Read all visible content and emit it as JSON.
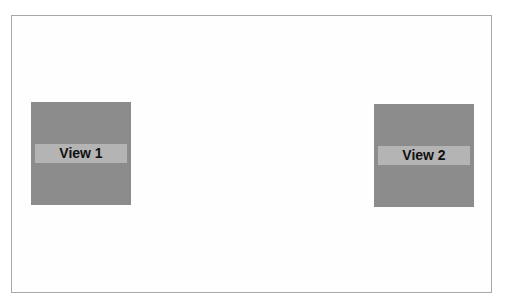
{
  "views": [
    {
      "label": "View 1"
    },
    {
      "label": "View 2"
    }
  ],
  "colors": {
    "frame_border": "#a8a8a8",
    "view_bg": "#8c8c8c",
    "label_bg": "#b4b4b4",
    "label_text": "#111111"
  }
}
